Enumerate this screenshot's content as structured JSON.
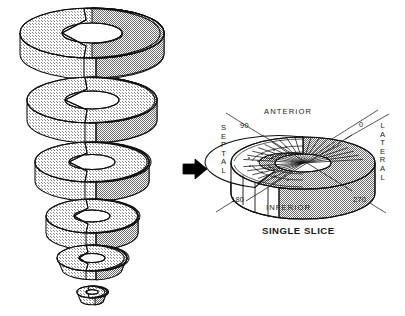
{
  "figure": {
    "caption": "SINGLE SLICE"
  },
  "colors": {
    "ink": "#1a1a1a",
    "stroke": "#111111",
    "light_gray": "#e2e2e2",
    "mid_gray": "#b4b4b4",
    "dark_gray": "#9a9a9a",
    "white": "#ffffff",
    "black": "#000000",
    "background": "#ffffff"
  },
  "stack": {
    "name": "exploded-slice-stack",
    "description": "Vertical exploded stack of myocardial short-axis ring slices, decreasing in diameter from base to apex",
    "slice_count": 6,
    "slices": [
      {
        "index": 1,
        "position": "base",
        "shape": "ring",
        "rx": 72,
        "ry": 25,
        "hole_rx": 30,
        "hole_ry": 10,
        "cy": 33,
        "thickness": 21
      },
      {
        "index": 2,
        "position": "basal-mid",
        "shape": "ring",
        "rx": 65,
        "ry": 23,
        "hole_rx": 27,
        "hole_ry": 9,
        "cy": 100,
        "thickness": 20
      },
      {
        "index": 3,
        "position": "mid",
        "shape": "ring",
        "rx": 57,
        "ry": 20,
        "hole_rx": 23,
        "hole_ry": 7.5,
        "cy": 162,
        "thickness": 19
      },
      {
        "index": 4,
        "position": "distal-mid",
        "shape": "ring",
        "rx": 46,
        "ry": 17,
        "hole_rx": 18,
        "hole_ry": 6,
        "cy": 216,
        "thickness": 17
      },
      {
        "index": 5,
        "position": "apical",
        "shape": "cap",
        "rx": 35,
        "ry": 13,
        "hole_rx": 13,
        "hole_ry": 4.5,
        "cy": 258,
        "thickness": 15
      },
      {
        "index": 6,
        "position": "apex",
        "shape": "cap",
        "rx": 15,
        "ry": 6,
        "hole_rx": 6,
        "hole_ry": 2.2,
        "cy": 292,
        "thickness": 9
      }
    ]
  },
  "arrow": {
    "name": "transform-arrow",
    "direction": "right",
    "x": 183,
    "y": 160
  },
  "slice": {
    "name": "single-slice-diagram",
    "center_x": 303,
    "center_y": 163,
    "rx": 72,
    "ry": 26,
    "thickness": 30,
    "cavity_rx": 28,
    "cavity_ry": 9,
    "sector_count": 20,
    "walls": [
      {
        "id": "anterior",
        "label": "ANTERIOR",
        "orientation": "horizontal",
        "x": 282,
        "y": 112
      },
      {
        "id": "inferior",
        "label": "INFERIOR",
        "orientation": "horizontal",
        "x": 283,
        "y": 208
      },
      {
        "id": "septal",
        "label": "SEPTAL",
        "orientation": "vertical",
        "x": 221,
        "y": 128
      },
      {
        "id": "lateral",
        "label": "LATERAL",
        "orientation": "vertical",
        "x": 379,
        "y": 126
      }
    ],
    "angles": [
      {
        "id": "deg-90",
        "label": "90",
        "x": 244,
        "y": 128,
        "corner": "upper-left"
      },
      {
        "id": "deg-0",
        "label": "0",
        "x": 360,
        "y": 126,
        "corner": "upper-right"
      },
      {
        "id": "deg-180",
        "label": "180",
        "x": 234,
        "y": 198,
        "corner": "lower-left"
      },
      {
        "id": "deg-270",
        "label": "270",
        "x": 355,
        "y": 198,
        "corner": "lower-right"
      }
    ],
    "axes": [
      {
        "id": "axis-90-270",
        "from": [
          226,
          113
        ],
        "to": [
          386,
          213
        ]
      },
      {
        "id": "axis-0-180",
        "from": [
          378,
          110
        ],
        "to": [
          216,
          212
        ]
      },
      {
        "id": "axis-0-aux",
        "from": [
          389,
          114
        ],
        "to": [
          345,
          139
        ]
      }
    ]
  }
}
